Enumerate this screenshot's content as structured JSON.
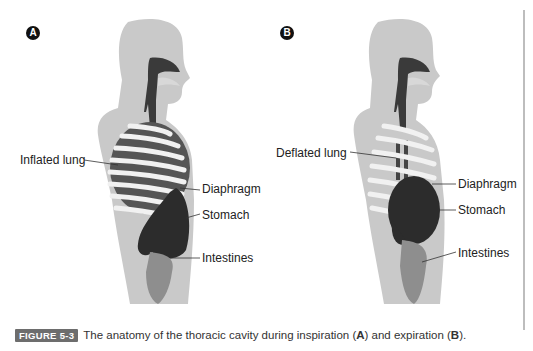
{
  "figure": {
    "tag": "FIGURE 5-3",
    "caption_prefix": "The anatomy of the thoracic cavity during inspiration (",
    "caption_a": "A",
    "caption_mid": ") and expiration (",
    "caption_b": "B",
    "caption_suffix": ")."
  },
  "panels": [
    {
      "badge": "A",
      "state": "inspiration",
      "labels": {
        "lung": "Inflated lung",
        "diaphragm": "Diaphragm",
        "stomach": "Stomach",
        "intestines": "Intestines"
      }
    },
    {
      "badge": "B",
      "state": "expiration",
      "labels": {
        "lung": "Deflated lung",
        "diaphragm": "Diaphragm",
        "stomach": "Stomach",
        "intestines": "Intestines"
      }
    }
  ],
  "colors": {
    "body": "#c9c9c9",
    "airway": "#3a3a3a",
    "rib": "#f1f1f1",
    "organ": "#2c2c2c",
    "intestine": "#8e8e8e",
    "tag_bg": "#6d6d6d"
  }
}
